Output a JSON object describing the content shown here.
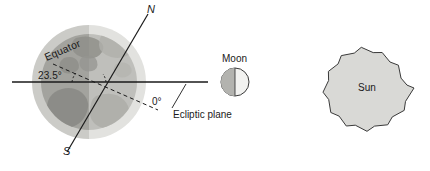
{
  "diagram": {
    "background_color": "#ffffff",
    "line_color": "#1a1a1a",
    "text_color": "#1a1a1a"
  },
  "earth": {
    "name": "Earth",
    "halo_color": "#d5d5d1",
    "night_color": "#a6a6a2",
    "day_color": "#c2c2be",
    "continent_color": "#989894",
    "center_x": 89,
    "center_y": 82,
    "radius": 57,
    "globe_radius": 48,
    "axis_tilt_degrees": "23.5",
    "axis": {
      "north_label": "N",
      "south_label": "S"
    },
    "equator_label": "Equator",
    "tilt_label": "23.5°",
    "ecliptic_angle_label": "0°"
  },
  "ecliptic": {
    "label": "Ecliptic plane",
    "line_start_x": 12,
    "line_end_x": 208,
    "line_y": 82
  },
  "moon": {
    "label": "Moon",
    "center_x": 235,
    "center_y": 82,
    "radius": 14,
    "dark_color": "#b3b3af",
    "light_color": "#f2f2f0"
  },
  "sun": {
    "label": "Sun",
    "center_x": 368,
    "center_y": 88,
    "outer_radius": 46,
    "inner_radius": 37,
    "points": 17,
    "fill_color": "#d9d9d6",
    "stroke_color": "#3a3a3a"
  }
}
